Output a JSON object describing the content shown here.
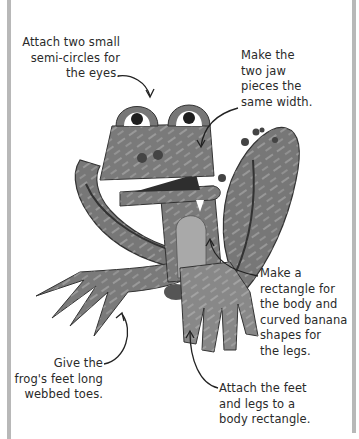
{
  "page": {
    "type": "craft-instruction-illustration",
    "colors": {
      "background": "#ffffff",
      "border": "#b8b8b8",
      "frog_body": "#7a7a7a",
      "frog_dark": "#3a3a3a",
      "frog_belly": "#a9a9a9",
      "text": "#2a2a2a"
    }
  },
  "annotations": [
    {
      "id": "eyes",
      "text": "Attach two small\nsemi-circles for\nthe eyes."
    },
    {
      "id": "jaw",
      "text": "Make the\ntwo jaw\npieces the\nsame width."
    },
    {
      "id": "body",
      "text": "Make a\nrectangle for\nthe body and\ncurved banana\nshapes for\nthe legs."
    },
    {
      "id": "toes",
      "text": "Give the\nfrog's feet long\nwebbed toes."
    },
    {
      "id": "feet",
      "text": "Attach the feet\nand legs to a\nbody rectangle."
    }
  ]
}
